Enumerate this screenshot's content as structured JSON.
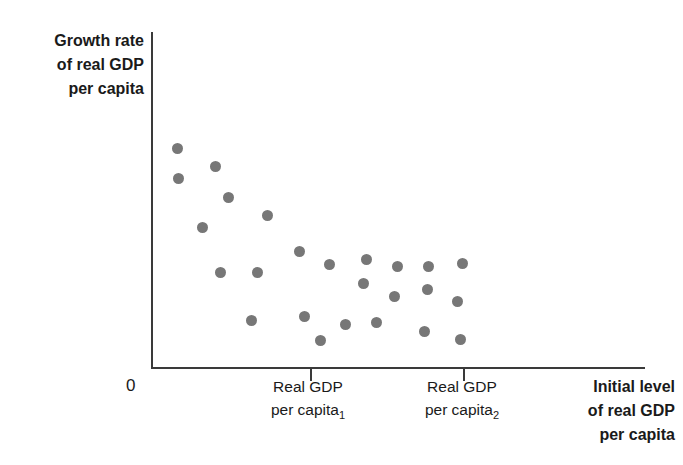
{
  "chart_data": {
    "type": "scatter",
    "title": "",
    "ylabel": "Growth rate of real GDP per capita",
    "xlabel": "Initial level of real GDP per capita",
    "grid": false,
    "legend": false,
    "axis_style": "schematic-no-numeric-scale",
    "xlim": [
      0,
      100
    ],
    "ylim": [
      0,
      100
    ],
    "x_ticks": [
      {
        "value": 32,
        "label_line1": "Real GDP",
        "label_line2": "per capita",
        "subscript": "1"
      },
      {
        "value": 63,
        "label_line1": "Real GDP",
        "label_line2": "per capita",
        "subscript": "2"
      }
    ],
    "origin_label": "0",
    "point_color": "#777777",
    "axis_color": "#3a3a3a",
    "points": [
      {
        "x": 5.1,
        "y": 65.3
      },
      {
        "x": 5.3,
        "y": 56.4
      },
      {
        "x": 12.8,
        "y": 59.9
      },
      {
        "x": 15.6,
        "y": 50.7
      },
      {
        "x": 23.5,
        "y": 45.1
      },
      {
        "x": 10.3,
        "y": 41.5
      },
      {
        "x": 29.9,
        "y": 34.4
      },
      {
        "x": 13.8,
        "y": 28.2
      },
      {
        "x": 21.3,
        "y": 28.2
      },
      {
        "x": 36.0,
        "y": 30.7
      },
      {
        "x": 43.5,
        "y": 32.2
      },
      {
        "x": 42.9,
        "y": 24.8
      },
      {
        "x": 49.8,
        "y": 30.0
      },
      {
        "x": 49.2,
        "y": 21.0
      },
      {
        "x": 56.1,
        "y": 30.0
      },
      {
        "x": 55.9,
        "y": 23.0
      },
      {
        "x": 63.0,
        "y": 30.9
      },
      {
        "x": 62.0,
        "y": 19.6
      },
      {
        "x": 20.1,
        "y": 13.8
      },
      {
        "x": 31.0,
        "y": 15.2
      },
      {
        "x": 34.1,
        "y": 7.8
      },
      {
        "x": 39.3,
        "y": 12.7
      },
      {
        "x": 45.6,
        "y": 13.4
      },
      {
        "x": 55.3,
        "y": 10.6
      },
      {
        "x": 62.5,
        "y": 8.3
      }
    ]
  },
  "labels": {
    "y_axis_title_lines": [
      "Growth rate",
      "of real GDP",
      "per capita"
    ],
    "x_axis_title_lines": [
      "Initial level",
      "of real GDP",
      "per capita"
    ],
    "origin": "0",
    "tick1_line1": "Real GDP",
    "tick1_line2": "per capita",
    "tick1_subscript": "1",
    "tick2_line1": "Real GDP",
    "tick2_line2": "per capita",
    "tick2_subscript": "2"
  }
}
